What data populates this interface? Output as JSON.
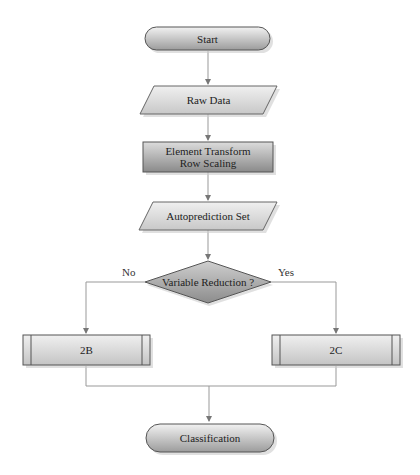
{
  "diagram": {
    "nodes": {
      "start": {
        "label": "Start",
        "shape": "terminator"
      },
      "raw_data": {
        "label": "Raw Data",
        "shape": "data-parallelogram"
      },
      "element_transform": {
        "label_line1": "Element Transform",
        "label_line2": "Row Scaling",
        "shape": "process"
      },
      "autoprediction": {
        "label": "Autoprediction Set",
        "shape": "data-parallelogram"
      },
      "decision": {
        "label": "Variable Reduction ?",
        "shape": "decision"
      },
      "b2": {
        "label": "2B",
        "shape": "predefined-process"
      },
      "c2": {
        "label": "2C",
        "shape": "predefined-process"
      },
      "classification": {
        "label": "Classification",
        "shape": "terminator"
      }
    },
    "edges": {
      "no": "No",
      "yes": "Yes"
    },
    "colors": {
      "fill_light": "#e4e4e4",
      "fill_dark": "#9a9a9a",
      "stroke": "#555555",
      "line": "#999999"
    }
  }
}
